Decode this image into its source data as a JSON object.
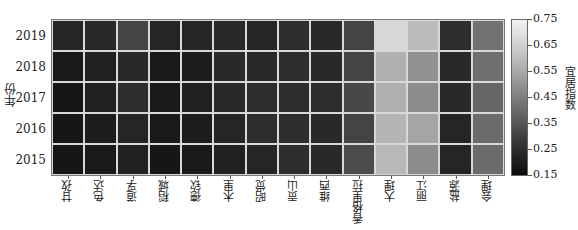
{
  "chart_data": {
    "type": "heatmap",
    "title": "",
    "xlabel": "",
    "ylabel": "年份",
    "x_categories": [
      "甘孜",
      "色达",
      "道孚",
      "稻城",
      "德钦",
      "木里",
      "昭觉",
      "贡山",
      "维西",
      "香格里拉",
      "大理",
      "丽江",
      "盐源",
      "会理"
    ],
    "y_categories": [
      "2019",
      "2018",
      "2017",
      "2016",
      "2015"
    ],
    "values": [
      [
        0.22,
        0.23,
        0.3,
        0.22,
        0.22,
        0.23,
        0.22,
        0.24,
        0.23,
        0.3,
        0.68,
        0.61,
        0.24,
        0.42
      ],
      [
        0.19,
        0.21,
        0.23,
        0.19,
        0.2,
        0.23,
        0.23,
        0.24,
        0.23,
        0.3,
        0.58,
        0.5,
        0.23,
        0.41
      ],
      [
        0.18,
        0.21,
        0.24,
        0.19,
        0.21,
        0.23,
        0.24,
        0.24,
        0.24,
        0.31,
        0.58,
        0.49,
        0.23,
        0.39
      ],
      [
        0.18,
        0.2,
        0.22,
        0.19,
        0.2,
        0.22,
        0.24,
        0.24,
        0.23,
        0.3,
        0.59,
        0.55,
        0.22,
        0.4
      ],
      [
        0.18,
        0.19,
        0.21,
        0.18,
        0.19,
        0.21,
        0.22,
        0.24,
        0.23,
        0.32,
        0.6,
        0.49,
        0.22,
        0.4
      ]
    ],
    "colorbar": {
      "label": "宜居指数",
      "range": [
        0.15,
        0.75
      ],
      "ticks": [
        "0.75",
        "0.65",
        "0.55",
        "0.45",
        "0.35",
        "0.25",
        "0.15"
      ],
      "colormap": "gray"
    },
    "grid": true,
    "grid_color": "#d8d8d8"
  }
}
